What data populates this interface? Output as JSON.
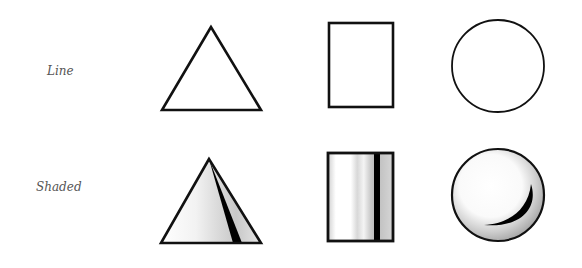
{
  "diagram": {
    "rows": [
      {
        "label": "Line",
        "style": "outline"
      },
      {
        "label": "Shaded",
        "style": "shaded"
      }
    ],
    "shapes": [
      "triangle",
      "rectangle",
      "circle"
    ]
  },
  "colors": {
    "stroke": "#111111",
    "shade_light": "#bbbbbb",
    "shade_dark": "#000000",
    "label": "#555555",
    "background": "#ffffff"
  }
}
